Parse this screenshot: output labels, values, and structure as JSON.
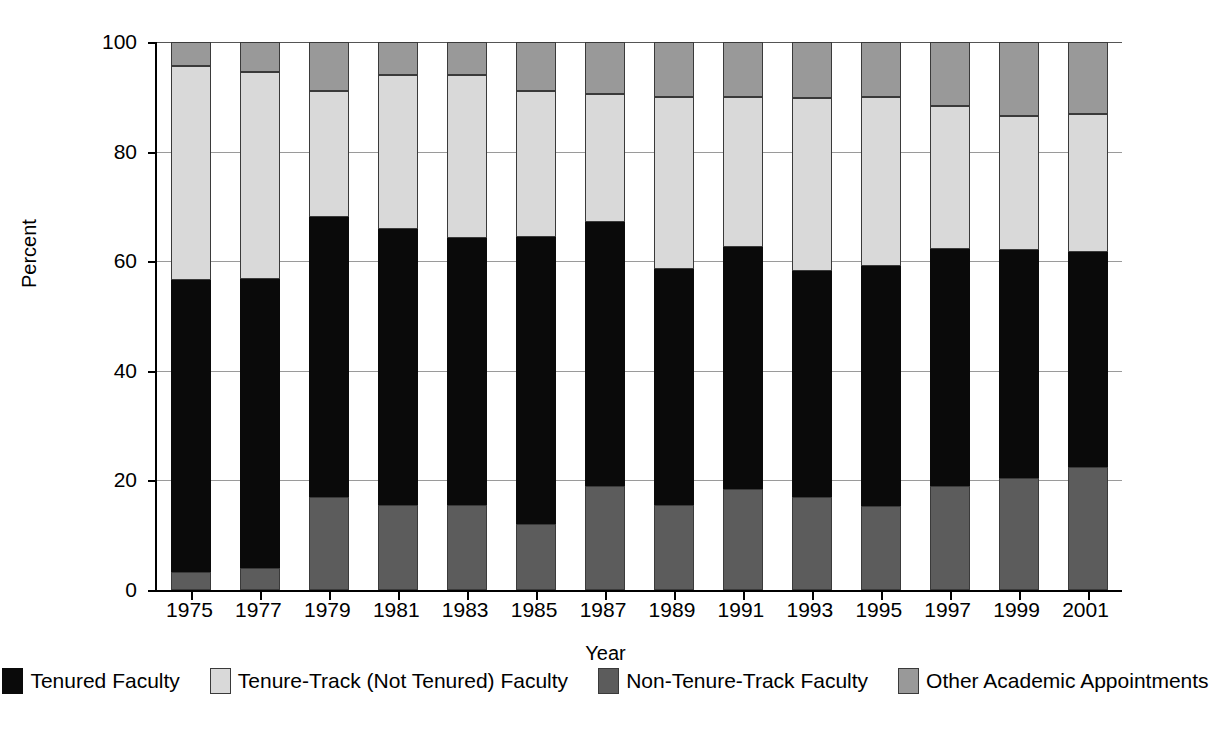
{
  "chart_data": {
    "type": "bar",
    "stacked": true,
    "title": "",
    "xlabel": "Year",
    "ylabel": "Percent",
    "ylim": [
      0,
      100
    ],
    "yticks": [
      0,
      20,
      40,
      60,
      80,
      100
    ],
    "grid": true,
    "legend_position": "bottom",
    "categories": [
      "1975",
      "1977",
      "1979",
      "1981",
      "1983",
      "1985",
      "1987",
      "1989",
      "1991",
      "1993",
      "1995",
      "1997",
      "1999",
      "2001"
    ],
    "series": [
      {
        "name": "Non-Tenure-Track Faculty",
        "color": "#5c5c5c",
        "values": [
          3.3,
          4.0,
          17.0,
          15.5,
          15.5,
          12.0,
          19.0,
          15.5,
          18.5,
          17.0,
          15.3,
          19.0,
          20.5,
          22.5
        ]
      },
      {
        "name": "Tenured Faculty",
        "color": "#0a0a0a",
        "values": [
          53.2,
          52.8,
          51.0,
          50.4,
          48.8,
          52.4,
          48.2,
          43.1,
          44.1,
          41.3,
          43.8,
          43.3,
          41.5,
          39.1
        ]
      },
      {
        "name": "Tenure-Track (Not Tenured) Faculty",
        "color": "#d9d9d9",
        "values": [
          39.1,
          37.7,
          23.0,
          28.0,
          29.7,
          26.6,
          23.4,
          31.4,
          27.4,
          31.5,
          30.9,
          26.0,
          24.5,
          25.3
        ]
      },
      {
        "name": "Other Academic Appointments",
        "color": "#999999",
        "values": [
          4.4,
          5.5,
          9.0,
          6.1,
          6.0,
          9.0,
          9.4,
          10.0,
          10.0,
          10.2,
          10.0,
          11.7,
          13.5,
          13.1
        ]
      }
    ],
    "cumulative_tops": {
      "1975": {
        "nontrack": 3.3,
        "tenured": 56.5,
        "track": 95.6,
        "other": 100
      },
      "1977": {
        "nontrack": 4.0,
        "tenured": 56.8,
        "track": 94.5,
        "other": 100
      },
      "1979": {
        "nontrack": 17.0,
        "tenured": 68.0,
        "track": 91.0,
        "other": 100
      },
      "1981": {
        "nontrack": 15.5,
        "tenured": 65.9,
        "track": 93.9,
        "other": 100
      },
      "1983": {
        "nontrack": 15.5,
        "tenured": 64.3,
        "track": 94.0,
        "other": 100
      },
      "1985": {
        "nontrack": 12.0,
        "tenured": 64.4,
        "track": 91.0,
        "other": 100
      },
      "1987": {
        "nontrack": 19.0,
        "tenured": 67.2,
        "track": 90.6,
        "other": 100
      },
      "1989": {
        "nontrack": 15.5,
        "tenured": 58.6,
        "track": 90.0,
        "other": 100
      },
      "1991": {
        "nontrack": 18.5,
        "tenured": 62.6,
        "track": 90.0,
        "other": 100
      },
      "1993": {
        "nontrack": 17.0,
        "tenured": 58.3,
        "track": 89.8,
        "other": 100
      },
      "1995": {
        "nontrack": 15.3,
        "tenured": 59.1,
        "track": 90.0,
        "other": 100
      },
      "1997": {
        "nontrack": 19.0,
        "tenured": 62.3,
        "track": 88.3,
        "other": 100
      },
      "1999": {
        "nontrack": 20.5,
        "tenured": 62.0,
        "track": 86.5,
        "other": 100
      },
      "2001": {
        "nontrack": 22.5,
        "tenured": 61.6,
        "track": 86.9,
        "other": 100
      }
    }
  },
  "axes": {
    "y_title": "Percent",
    "x_title": "Year",
    "y_tick_labels": [
      "0",
      "20",
      "40",
      "60",
      "80",
      "100"
    ],
    "x_tick_labels": [
      "1975",
      "1977",
      "1979",
      "1981",
      "1983",
      "1985",
      "1987",
      "1989",
      "1991",
      "1993",
      "1995",
      "1997",
      "1999",
      "2001"
    ]
  },
  "legend": {
    "items": [
      {
        "label": "Tenured Faculty",
        "swatch": "s-tenured",
        "color": "#0a0a0a"
      },
      {
        "label": "Tenure-Track (Not Tenured) Faculty",
        "swatch": "s-track",
        "color": "#d9d9d9"
      },
      {
        "label": "Non-Tenure-Track Faculty",
        "swatch": "s-nontrack",
        "color": "#5c5c5c"
      },
      {
        "label": "Other Academic Appointments",
        "swatch": "s-other",
        "color": "#999999"
      }
    ]
  }
}
